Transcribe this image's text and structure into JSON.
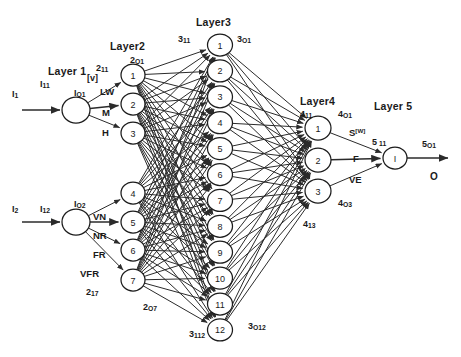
{
  "diagram": {
    "background_color": "#ffffff",
    "line_color": "#2b2b2b",
    "node_fill": "#ffffff"
  },
  "layer_titles": {
    "layer1": "Layer 1",
    "layer2": "Layer2",
    "layer3": "Layer3",
    "layer4": "Layer4",
    "layer5": "Layer 5"
  },
  "inputs": [
    {
      "signal": "I",
      "signal_sub": "1",
      "weight": "I",
      "weight_sub": "11"
    },
    {
      "signal": "I",
      "signal_sub": "2",
      "weight": "I",
      "weight_sub": "12"
    }
  ],
  "output": {
    "label": "O",
    "weight": "5",
    "weight_sub": "O1"
  },
  "annotations": {
    "layer1_out_top": {
      "text": "I",
      "sub": "O1"
    },
    "layer1_out_bottom": {
      "text": "I",
      "sub": "O2"
    },
    "layer1_bracket": "[v]",
    "layer2_in_first": {
      "text": "2",
      "sub": "11"
    },
    "layer2_out_first": {
      "text": "2",
      "sub": "O1"
    },
    "layer2_in_last": {
      "text": "2",
      "sub": "17"
    },
    "layer2_out_last": {
      "text": "2",
      "sub": "O7"
    },
    "layer3_in_first": {
      "text": "3",
      "sub": "11"
    },
    "layer3_out_first": {
      "text": "3",
      "sub": "O1"
    },
    "layer3_in_last": {
      "text": "3",
      "sub": "112"
    },
    "layer3_out_last": {
      "text": "3",
      "sub": "O12"
    },
    "layer4_in_first": {
      "text": "4",
      "sub": "11"
    },
    "layer4_out_first": {
      "text": "4",
      "sub": "O1"
    },
    "layer4_in_last": {
      "text": "4",
      "sub": "13"
    },
    "layer4_out_last": {
      "text": "4",
      "sub": "O3"
    },
    "layer5_in": {
      "text": "5",
      "sub": "11"
    },
    "layer5_out": {
      "text": "5",
      "sub": "O1"
    }
  },
  "edge_labels": {
    "layer1_to_layer2_top": [
      "LW",
      "M",
      "H"
    ],
    "layer1_to_layer2_bottom": [
      "VN",
      "NR",
      "FR",
      "VFR"
    ],
    "layer4_to_layer5": [
      {
        "text": "S",
        "sup": "[W]"
      },
      {
        "text": "F",
        "sup": ""
      },
      {
        "text": "VE",
        "sup": ""
      }
    ]
  },
  "nodes": {
    "layer1": [
      {
        "label": ""
      },
      {
        "label": ""
      }
    ],
    "layer2": [
      {
        "label": "1"
      },
      {
        "label": "2"
      },
      {
        "label": "3"
      },
      {
        "label": "4"
      },
      {
        "label": "5"
      },
      {
        "label": "6"
      },
      {
        "label": "7"
      }
    ],
    "layer3": [
      {
        "label": "1"
      },
      {
        "label": "2"
      },
      {
        "label": "3"
      },
      {
        "label": "4"
      },
      {
        "label": "5"
      },
      {
        "label": "6"
      },
      {
        "label": "7"
      },
      {
        "label": "8"
      },
      {
        "label": "9"
      },
      {
        "label": "10"
      },
      {
        "label": "11"
      },
      {
        "label": "12"
      }
    ],
    "layer4": [
      {
        "label": "1"
      },
      {
        "label": "2"
      },
      {
        "label": "3"
      }
    ],
    "layer5": [
      {
        "label": "I"
      }
    ]
  }
}
